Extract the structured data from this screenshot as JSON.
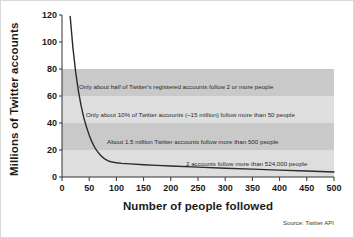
{
  "chart_data": {
    "type": "line",
    "title": "",
    "xlabel": "Number of people followed",
    "ylabel": "Millions of Twitter accounts",
    "xlim": [
      0,
      500
    ],
    "ylim": [
      0,
      120
    ],
    "xticks": [
      "0",
      "50",
      "100",
      "150",
      "200",
      "250",
      "300",
      "350",
      "400",
      "450",
      "500"
    ],
    "yticks": [
      "0",
      "20",
      "40",
      "60",
      "80",
      "100",
      "120"
    ],
    "grid": false,
    "legend": null,
    "series": [
      {
        "name": "Twitter accounts following N people",
        "x": [
          15,
          20,
          25,
          30,
          35,
          40,
          45,
          50,
          55,
          60,
          65,
          70,
          75,
          80,
          85,
          90,
          100,
          110,
          125,
          150,
          175,
          200,
          250,
          300,
          350,
          400,
          450,
          500
        ],
        "values": [
          119,
          96,
          78,
          64,
          53,
          44,
          37,
          31,
          26,
          22,
          19,
          16.5,
          14.5,
          13,
          12,
          11.3,
          10.5,
          10.1,
          9.7,
          9.1,
          8.6,
          8.1,
          7.3,
          6.5,
          5.8,
          5.1,
          4.4,
          3.7
        ]
      }
    ],
    "bands": [
      {
        "from": 60,
        "to": 80,
        "color": "#c9c9c9"
      },
      {
        "from": 40,
        "to": 60,
        "color": "#dedede"
      },
      {
        "from": 20,
        "to": 40,
        "color": "#c9c9c9"
      },
      {
        "from": 0,
        "to": 20,
        "color": "#dedede"
      }
    ],
    "annotations": [
      {
        "text": "Only about half of Twitter's registered accounts follow 2 or more people",
        "x_px": 78,
        "y_px": 88
      },
      {
        "text": "Only about 10% of Twitter accounts (~15 million) follow more than 50 people",
        "x_px": 85,
        "y_px": 116
      },
      {
        "text": "About 1.5 million Twitter accounts follow more than 500 people",
        "x_px": 106,
        "y_px": 143
      },
      {
        "text": "2 accounts follow more than 524,000 people",
        "x_px": 185,
        "y_px": 165
      }
    ],
    "source": "Source: Twitter API"
  }
}
